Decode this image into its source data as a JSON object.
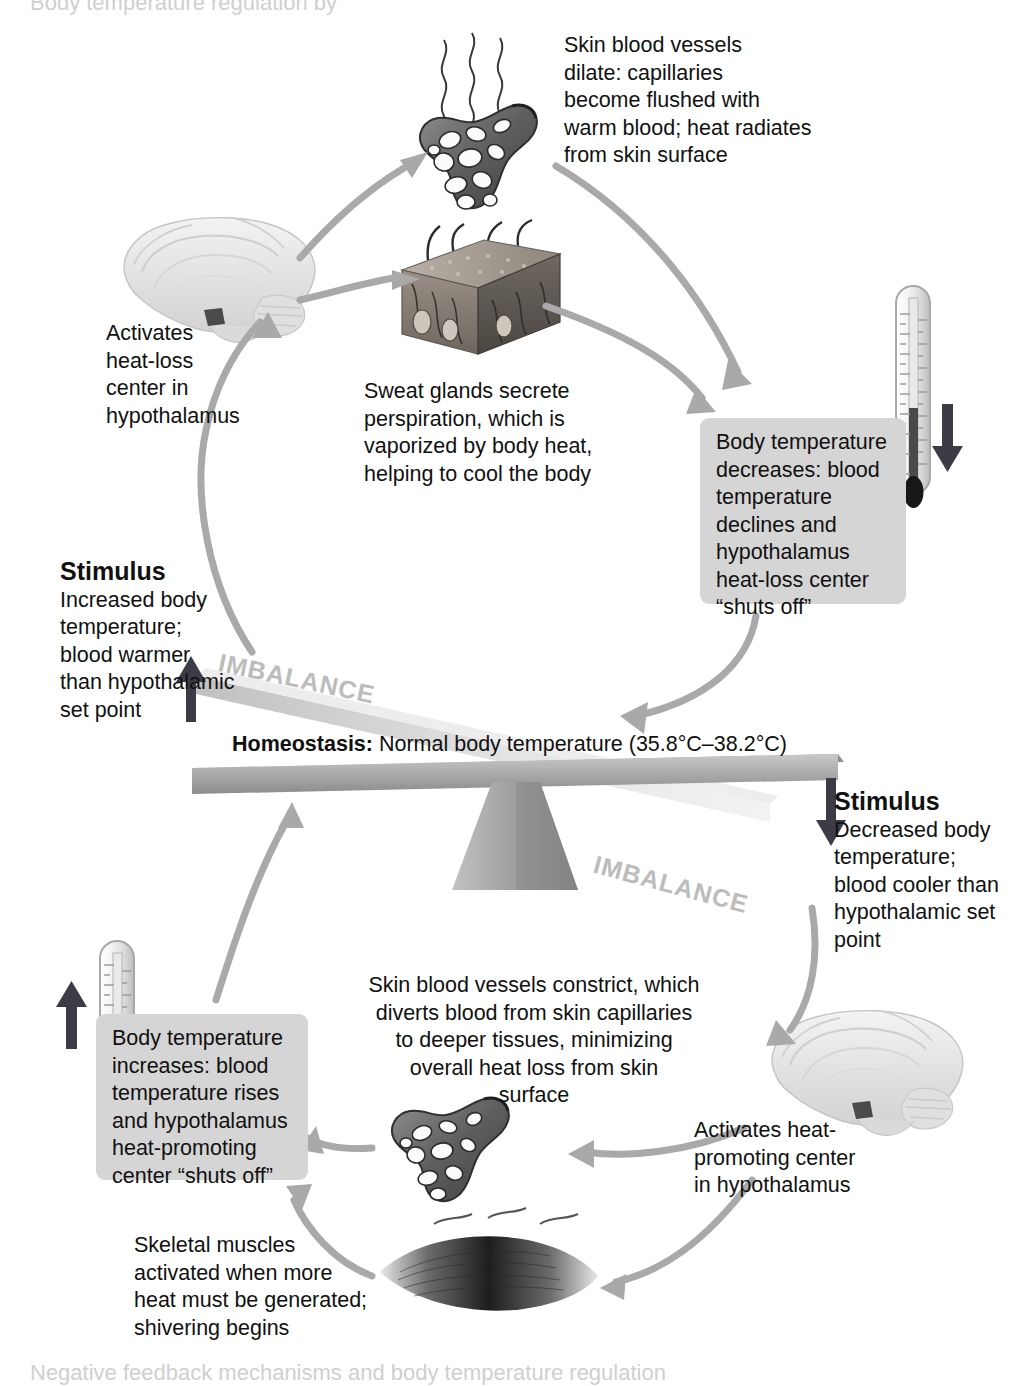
{
  "figure": {
    "type": "homeostasis-feedback-loop-diagram",
    "top_cut_text": "Body temperature regulation by",
    "bottom_cut_text": "Negative feedback mechanisms and body temperature regulation"
  },
  "balance": {
    "homeostasis_label": "Homeostasis:",
    "homeostasis_text": " Normal body temperature (35.8°C–38.2°C)",
    "imbalance_left": "IMBALANCE",
    "imbalance_right": "IMBALANCE"
  },
  "heat_loss_loop": {
    "vessel_caption": "Skin blood vessels\ndilate: capillaries\nbecome flushed with\nwarm blood; heat radiates\nfrom skin surface",
    "sweat_caption": "Sweat glands secrete\nperspiration, which is\nvaporized by body heat,\nhelping to cool the body",
    "hypothalamus_caption": "Activates\nheat-loss\ncenter in\nhypothalamus",
    "result_box": "Body temperature\ndecreases: blood\ntemperature\ndeclines and\nhypothalamus\nheat-loss center\n“shuts off”",
    "stimulus_title": "Stimulus",
    "stimulus_body": "Increased body\ntemperature;\nblood warmer\nthan hypothalamic\nset point"
  },
  "heat_promoting_loop": {
    "stimulus_title": "Stimulus",
    "stimulus_body": "Decreased body\ntemperature;\nblood cooler than\nhypothalamic set\npoint",
    "hypothalamus_caption": "Activates heat-\npromoting center\nin hypothalamus",
    "vessel_caption": "Skin blood vessels constrict, which\ndiverts blood from skin capillaries\nto deeper tissues, minimizing\noverall heat loss from skin\nsurface",
    "muscle_caption": "Skeletal muscles\nactivated when more\nheat must be generated;\nshivering begins",
    "result_box": "Body temperature\nincreases: blood\ntemperature rises\nand hypothalamus\nheat-promoting\ncenter “shuts off”"
  },
  "icons": {
    "brain_top": "brain-sagittal-illustration",
    "brain_bottom": "brain-sagittal-illustration",
    "skin_block": "skin-cross-section-illustration",
    "capillary_top": "dilated-capillary-bed-illustration",
    "capillary_bottom": "constricted-capillary-bed-illustration",
    "muscle": "skeletal-muscle-illustration",
    "thermometer_down": "thermometer-with-down-arrow",
    "thermometer_up": "thermometer-with-up-arrow",
    "heat_waves": "radiating-heat-wavy-lines",
    "seesaw": "balance-seesaw-scale"
  },
  "colors": {
    "arrow_gray": "#a9a9a9",
    "box_gray": "#d5d5d5",
    "imbalance_gray": "#bcbcbc",
    "text_black": "#111111",
    "arrow_dark": "#3c3c46"
  }
}
